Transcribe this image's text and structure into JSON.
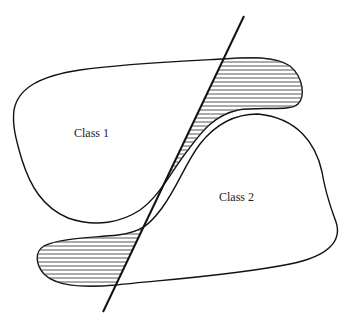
{
  "diagram": {
    "type": "decision-boundary-illustration",
    "regions": [
      {
        "id": "class1",
        "label": "Class 1"
      },
      {
        "id": "class2",
        "label": "Class 2"
      }
    ],
    "boundary": {
      "kind": "straight-line",
      "from": [
        244,
        16
      ],
      "to": [
        103,
        312
      ]
    },
    "misclassified_regions": [
      {
        "location": "upper-right lobe of Class 1 beyond the line",
        "fill": "horizontal-hatch"
      },
      {
        "location": "lower-left lobe of Class 2 beyond the line",
        "fill": "horizontal-hatch"
      }
    ],
    "colors": {
      "stroke": "#111111",
      "hatch": "#555555",
      "background": "#ffffff",
      "text": "#222222"
    }
  },
  "labels": {
    "class1": "Class 1",
    "class2": "Class 2"
  }
}
